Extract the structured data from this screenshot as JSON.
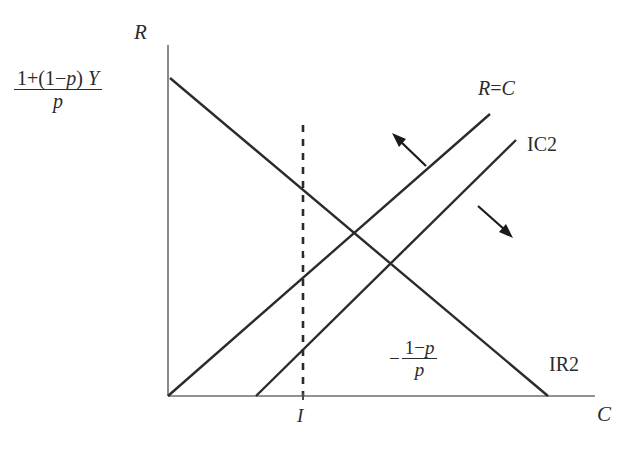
{
  "figure": {
    "type": "economics-line-diagram",
    "background": "#ffffff",
    "line_color": "#2b2b2b",
    "axis_color": "#6b6b6b"
  },
  "axes": {
    "y_label": "R",
    "x_label": "C",
    "origin": {
      "x": 168,
      "y": 396
    },
    "y_top": 45,
    "x_right": 595
  },
  "labels": {
    "y_intercept": {
      "text": "1+(1-p) Y / p",
      "numerator_pre": "1+(1−",
      "numerator_var": "p",
      "numerator_post": ") ",
      "numerator_y": "Y",
      "denominator": "p"
    },
    "slope": {
      "text": "-(1-p)/p",
      "sign": "−",
      "numerator_pre": "1−",
      "numerator_var": "p",
      "denominator": "p"
    },
    "tick_I": "I",
    "line_rc": "R = C",
    "line_rc_left": "R",
    "line_rc_eq": "=",
    "line_rc_right": "C",
    "line_ic2": "IC2",
    "line_ir2": "IR2"
  },
  "lines": [
    {
      "name": "IR2",
      "label": "IR2",
      "style": "solid",
      "description": "downward sloping budget / insurance line",
      "from": {
        "x": 170,
        "y": 78
      },
      "to": {
        "x": 548,
        "y": 396
      }
    },
    {
      "name": "R=C",
      "label": "R = C",
      "style": "solid",
      "description": "45 degree full insurance line from origin",
      "from": {
        "x": 168,
        "y": 396
      },
      "to": {
        "x": 490,
        "y": 114
      }
    },
    {
      "name": "IC2",
      "label": "IC2",
      "style": "solid",
      "description": "indifference curve, parallel to 45 degree line",
      "from": {
        "x": 256,
        "y": 396
      },
      "to": {
        "x": 516,
        "y": 140
      }
    },
    {
      "name": "I-line",
      "label": "I",
      "style": "dashed",
      "description": "vertical dashed line at income level I",
      "from": {
        "x": 303,
        "y": 125
      },
      "to": {
        "x": 303,
        "y": 396
      }
    }
  ],
  "arrows": [
    {
      "name": "up-left-arrow",
      "direction": "up-left",
      "from": {
        "x": 426,
        "y": 165
      },
      "to": {
        "x": 396,
        "y": 137
      }
    },
    {
      "name": "down-right-arrow",
      "direction": "down-right",
      "from": {
        "x": 478,
        "y": 207
      },
      "to": {
        "x": 510,
        "y": 235
      }
    }
  ]
}
